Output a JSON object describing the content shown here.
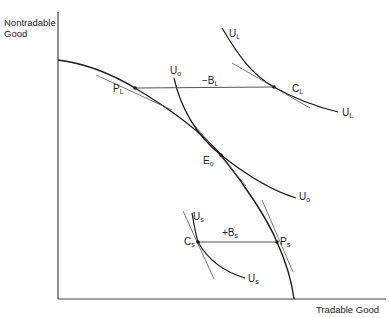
{
  "axes": {
    "y_label_line1": "Nontradable",
    "y_label_line2": "Good",
    "x_label": "Tradable Good"
  },
  "curves": {
    "ppf": "production-possibility-frontier",
    "indifference": [
      "U_L",
      "U_o",
      "U_s"
    ]
  },
  "labels": {
    "UL_top": {
      "main": "U",
      "sub": "L"
    },
    "UL_right": {
      "main": "U",
      "sub": "L"
    },
    "CL": {
      "main": "C",
      "sub": "L"
    },
    "BL": {
      "main": "−B",
      "sub": "L"
    },
    "PL": {
      "main": "P",
      "sub": "L"
    },
    "Uo_top": {
      "main": "U",
      "sub": "o"
    },
    "Uo_right": {
      "main": "U",
      "sub": "o"
    },
    "Eo": {
      "main": "E",
      "sub": "o"
    },
    "Us_top": {
      "main": "U",
      "sub": "s"
    },
    "Us_bottom": {
      "main": "U",
      "sub": "s"
    },
    "Cs": {
      "main": "C",
      "sub": "s"
    },
    "Bs": {
      "main": "+B",
      "sub": "s"
    },
    "Ps": {
      "main": "P",
      "sub": "s"
    }
  },
  "colors": {
    "line": "#1a1a1a",
    "thin_line": "#555555",
    "axis": "#444444"
  }
}
